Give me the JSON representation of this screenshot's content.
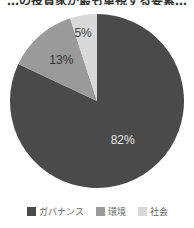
{
  "title": "…の投資家が最も重視する要素…",
  "chart_data": {
    "type": "pie",
    "title": "",
    "categories": [
      "ガバナンス",
      "環境",
      "社会"
    ],
    "values": [
      82,
      13,
      5
    ],
    "labels": [
      "82%",
      "13%",
      "5%"
    ],
    "colors": [
      "#4a4a4a",
      "#9a9a9a",
      "#d9d9d9"
    ],
    "start_angle": "12 o'clock, clockwise",
    "legend_position": "bottom"
  },
  "legend": [
    {
      "label": "ガバナンス",
      "color": "#4a4a4a"
    },
    {
      "label": "環境",
      "color": "#9a9a9a"
    },
    {
      "label": "社会",
      "color": "#d9d9d9"
    }
  ]
}
